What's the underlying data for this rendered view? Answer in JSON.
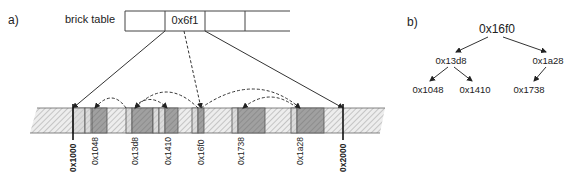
{
  "panel_a": {
    "label": "a)",
    "brick_table": {
      "title": "brick table",
      "cells": [
        "",
        "0x6f1",
        "",
        ""
      ],
      "highlighted_cell": "0x6f1"
    },
    "memory_bar": {
      "address_labels": [
        "0x1000",
        "0x1048",
        "0x13d8",
        "0x1410",
        "0x16f0",
        "0x1738",
        "0x1a28",
        "0x2000"
      ],
      "bold_labels": [
        "0x1000",
        "0x2000"
      ],
      "colors": {
        "hatched_free": "#e8e8e8",
        "light_block": "#d6d6d6",
        "dark_block": "#9a9a9a",
        "outline": "#555555"
      }
    }
  },
  "panel_b": {
    "label": "b)",
    "tree": {
      "root": "0x16f0",
      "level1": [
        "0x13d8",
        "0x1a28"
      ],
      "level2": [
        "0x1048",
        "0x1410",
        "0x1738"
      ]
    }
  }
}
